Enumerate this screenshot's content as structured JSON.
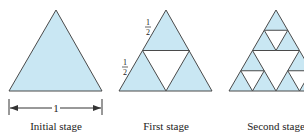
{
  "figure": {
    "fill_color": "#c9e7f3",
    "stroke_color": "#4a4a4a",
    "stages": [
      {
        "label": "Initial stage",
        "dimension_label": "1"
      },
      {
        "label": "First stage",
        "side_labels": [
          "1",
          "2",
          "1",
          "2"
        ]
      },
      {
        "label": "Second stage"
      }
    ]
  }
}
